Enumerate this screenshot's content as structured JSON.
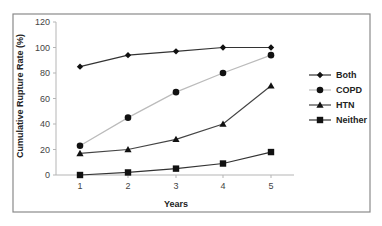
{
  "chart_data": {
    "type": "line",
    "title": "",
    "xlabel": "Years",
    "ylabel": "Cumulative Rupture Rate (%)",
    "x": [
      1,
      2,
      3,
      4,
      5
    ],
    "x_tick_labels": [
      "1",
      "2",
      "3",
      "4",
      "5"
    ],
    "y_tick_labels": [
      "0",
      "20",
      "40",
      "60",
      "80",
      "100",
      "120"
    ],
    "ylim": [
      0,
      120
    ],
    "grid": false,
    "legend_position": "right",
    "series": [
      {
        "name": "Both",
        "marker": "diamond",
        "color": "#333333",
        "values": [
          85,
          94,
          97,
          100,
          100
        ]
      },
      {
        "name": "COPD",
        "marker": "circle",
        "color": "#bbbbbb",
        "values": [
          23,
          45,
          65,
          80,
          94
        ]
      },
      {
        "name": "HTN",
        "marker": "triangle",
        "color": "#444444",
        "values": [
          17,
          20,
          28,
          40,
          70
        ]
      },
      {
        "name": "Neither",
        "marker": "square",
        "color": "#333333",
        "values": [
          0,
          2,
          5,
          9,
          18
        ]
      }
    ]
  },
  "legend": {
    "items": [
      {
        "label": "Both"
      },
      {
        "label": "COPD"
      },
      {
        "label": "HTN"
      },
      {
        "label": "Neither"
      }
    ]
  }
}
